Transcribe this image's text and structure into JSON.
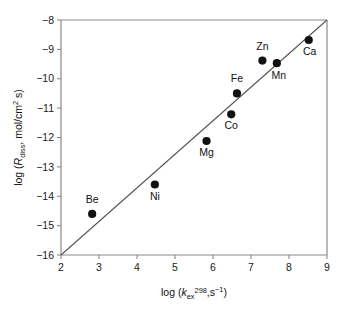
{
  "chart_data": {
    "type": "scatter",
    "title": "",
    "xlabel": "log (kex298,s-1)",
    "ylabel": "log (Rdiss, mol/cm2 s)",
    "xlabel_parts": {
      "prefix": "log (",
      "symbol": "k",
      "subscript": "ex",
      "superscript": "298",
      "middle": ",s",
      "exponent": "−1",
      "suffix": ")"
    },
    "ylabel_parts": {
      "prefix": "log (",
      "symbol": "R",
      "subscript": "diss",
      "middle": ", mol/cm",
      "exponent": "2",
      "suffix": " s)"
    },
    "xlim": [
      2,
      9
    ],
    "ylim": [
      -16,
      -8
    ],
    "xticks": [
      2,
      3,
      4,
      5,
      6,
      7,
      8,
      9
    ],
    "yticks": [
      -16,
      -15,
      -14,
      -13,
      -12,
      -11,
      -10,
      -9,
      -8
    ],
    "xtick_labels": [
      "2",
      "3",
      "4",
      "5",
      "6",
      "7",
      "8",
      "9"
    ],
    "ytick_labels": [
      "−16",
      "−15",
      "−14",
      "−13",
      "−12",
      "−11",
      "−10",
      "−9",
      "−8"
    ],
    "grid": false,
    "legend": "none",
    "marker_color": "#111111",
    "line_color": "#555555",
    "axis_color": "#8a8a8a",
    "points": [
      {
        "label": "Be",
        "x": 2.82,
        "y": -14.6,
        "label_dx": 0,
        "label_dy": -11
      },
      {
        "label": "Ni",
        "x": 4.47,
        "y": -13.6,
        "label_dx": 0,
        "label_dy": 15
      },
      {
        "label": "Mg",
        "x": 5.83,
        "y": -12.12,
        "label_dx": 0,
        "label_dy": 15
      },
      {
        "label": "Co",
        "x": 6.48,
        "y": -11.21,
        "label_dx": 0,
        "label_dy": 15
      },
      {
        "label": "Fe",
        "x": 6.63,
        "y": -10.5,
        "label_dx": 0,
        "label_dy": -11
      },
      {
        "label": "Zn",
        "x": 7.3,
        "y": -9.38,
        "label_dx": 0,
        "label_dy": -11
      },
      {
        "label": "Mn",
        "x": 7.68,
        "y": -9.47,
        "label_dx": 2,
        "label_dy": 16
      },
      {
        "label": "Ca",
        "x": 8.52,
        "y": -8.68,
        "label_dx": 1,
        "label_dy": 15
      }
    ],
    "fit_line": {
      "x1": 2,
      "y1": -16,
      "x2": 9,
      "y2": -8,
      "slope": 1.14,
      "intercept": -18.29
    }
  }
}
